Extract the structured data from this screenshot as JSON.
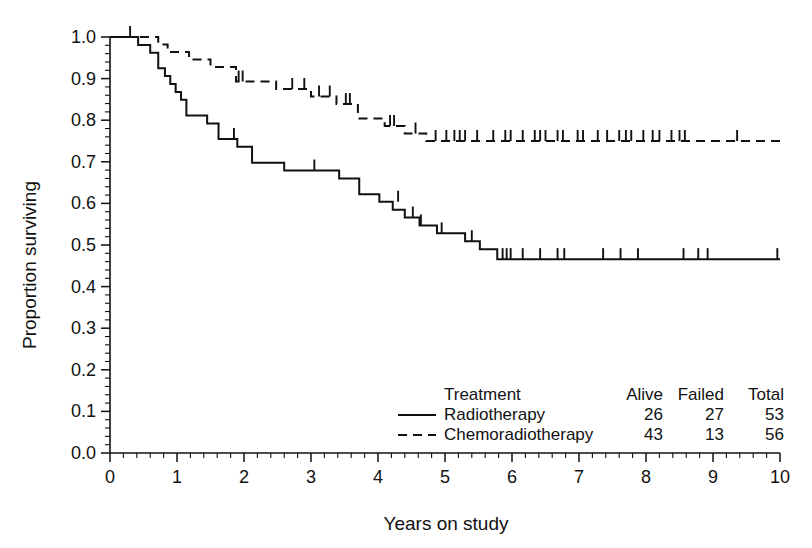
{
  "chart_data": {
    "type": "line",
    "subtype": "kaplan-meier-survival",
    "title": "",
    "xlabel": "Years on study",
    "ylabel": "Proportion surviving",
    "xlim": [
      0,
      10
    ],
    "ylim": [
      0,
      1
    ],
    "xticks": [
      "0",
      "1",
      "2",
      "3",
      "4",
      "5",
      "6",
      "7",
      "8",
      "9",
      "10"
    ],
    "yticks": [
      "0.0",
      "0.1",
      "0.2",
      "0.3",
      "0.4",
      "0.5",
      "0.6",
      "0.7",
      "0.8",
      "0.9",
      "1.0"
    ],
    "x_minor_per_major": 4,
    "y_minor_per_major": 4,
    "grid": false,
    "legend_position": "inside-lower-right",
    "series": [
      {
        "name": "Radiotherapy",
        "linestyle": "solid",
        "color": "#111111",
        "alive": 26,
        "failed": 27,
        "total": 53,
        "steps": [
          [
            0.0,
            1.0
          ],
          [
            0.42,
            1.0
          ],
          [
            0.42,
            0.981
          ],
          [
            0.6,
            0.981
          ],
          [
            0.6,
            0.962
          ],
          [
            0.72,
            0.962
          ],
          [
            0.72,
            0.925
          ],
          [
            0.82,
            0.925
          ],
          [
            0.82,
            0.906
          ],
          [
            0.9,
            0.906
          ],
          [
            0.9,
            0.887
          ],
          [
            0.98,
            0.887
          ],
          [
            0.98,
            0.868
          ],
          [
            1.06,
            0.868
          ],
          [
            1.06,
            0.849
          ],
          [
            1.14,
            0.849
          ],
          [
            1.14,
            0.811
          ],
          [
            1.45,
            0.811
          ],
          [
            1.45,
            0.792
          ],
          [
            1.62,
            0.792
          ],
          [
            1.62,
            0.755
          ],
          [
            1.9,
            0.755
          ],
          [
            1.9,
            0.736
          ],
          [
            2.12,
            0.736
          ],
          [
            2.12,
            0.698
          ],
          [
            2.6,
            0.698
          ],
          [
            2.6,
            0.679
          ],
          [
            3.42,
            0.679
          ],
          [
            3.42,
            0.66
          ],
          [
            3.72,
            0.66
          ],
          [
            3.72,
            0.622
          ],
          [
            4.02,
            0.622
          ],
          [
            4.02,
            0.604
          ],
          [
            4.22,
            0.604
          ],
          [
            4.22,
            0.585
          ],
          [
            4.4,
            0.585
          ],
          [
            4.4,
            0.566
          ],
          [
            4.62,
            0.566
          ],
          [
            4.62,
            0.547
          ],
          [
            4.88,
            0.547
          ],
          [
            4.88,
            0.528
          ],
          [
            5.3,
            0.528
          ],
          [
            5.3,
            0.509
          ],
          [
            5.52,
            0.509
          ],
          [
            5.52,
            0.49
          ],
          [
            5.78,
            0.49
          ],
          [
            5.78,
            0.466
          ],
          [
            10.0,
            0.466
          ]
        ],
        "censored": [
          [
            0.3,
            1.0
          ],
          [
            1.85,
            0.755
          ],
          [
            3.05,
            0.679
          ],
          [
            4.3,
            0.604
          ],
          [
            4.52,
            0.566
          ],
          [
            4.64,
            0.547
          ],
          [
            4.95,
            0.528
          ],
          [
            5.4,
            0.509
          ],
          [
            5.86,
            0.466
          ],
          [
            5.92,
            0.466
          ],
          [
            5.98,
            0.466
          ],
          [
            6.16,
            0.466
          ],
          [
            6.42,
            0.466
          ],
          [
            6.68,
            0.466
          ],
          [
            6.78,
            0.466
          ],
          [
            7.36,
            0.466
          ],
          [
            7.62,
            0.466
          ],
          [
            7.88,
            0.466
          ],
          [
            8.56,
            0.466
          ],
          [
            8.78,
            0.466
          ],
          [
            8.92,
            0.466
          ],
          [
            9.96,
            0.466
          ]
        ]
      },
      {
        "name": "Chemoradiotherapy",
        "linestyle": "dashed",
        "color": "#111111",
        "alive": 43,
        "failed": 13,
        "total": 56,
        "steps": [
          [
            0.0,
            1.0
          ],
          [
            0.72,
            1.0
          ],
          [
            0.72,
            0.982
          ],
          [
            0.86,
            0.982
          ],
          [
            0.86,
            0.964
          ],
          [
            1.18,
            0.964
          ],
          [
            1.18,
            0.946
          ],
          [
            1.5,
            0.946
          ],
          [
            1.5,
            0.928
          ],
          [
            1.88,
            0.928
          ],
          [
            1.88,
            0.893
          ],
          [
            2.48,
            0.893
          ],
          [
            2.48,
            0.875
          ],
          [
            3.0,
            0.875
          ],
          [
            3.0,
            0.857
          ],
          [
            3.38,
            0.857
          ],
          [
            3.38,
            0.839
          ],
          [
            3.7,
            0.839
          ],
          [
            3.7,
            0.804
          ],
          [
            4.1,
            0.804
          ],
          [
            4.1,
            0.786
          ],
          [
            4.4,
            0.786
          ],
          [
            4.4,
            0.768
          ],
          [
            4.72,
            0.768
          ],
          [
            4.72,
            0.75
          ],
          [
            10.0,
            0.75
          ]
        ],
        "censored": [
          [
            1.92,
            0.893
          ],
          [
            1.98,
            0.893
          ],
          [
            2.72,
            0.875
          ],
          [
            2.9,
            0.875
          ],
          [
            3.12,
            0.857
          ],
          [
            3.28,
            0.857
          ],
          [
            3.52,
            0.839
          ],
          [
            3.58,
            0.839
          ],
          [
            4.18,
            0.786
          ],
          [
            4.24,
            0.786
          ],
          [
            4.56,
            0.768
          ],
          [
            4.86,
            0.75
          ],
          [
            5.02,
            0.75
          ],
          [
            5.14,
            0.75
          ],
          [
            5.22,
            0.75
          ],
          [
            5.3,
            0.75
          ],
          [
            5.48,
            0.75
          ],
          [
            5.72,
            0.75
          ],
          [
            5.9,
            0.75
          ],
          [
            5.98,
            0.75
          ],
          [
            6.16,
            0.75
          ],
          [
            6.34,
            0.75
          ],
          [
            6.42,
            0.75
          ],
          [
            6.5,
            0.75
          ],
          [
            6.68,
            0.75
          ],
          [
            6.76,
            0.75
          ],
          [
            6.98,
            0.75
          ],
          [
            7.06,
            0.75
          ],
          [
            7.28,
            0.75
          ],
          [
            7.42,
            0.75
          ],
          [
            7.6,
            0.75
          ],
          [
            7.7,
            0.75
          ],
          [
            7.78,
            0.75
          ],
          [
            7.96,
            0.75
          ],
          [
            8.1,
            0.75
          ],
          [
            8.2,
            0.75
          ],
          [
            8.38,
            0.75
          ],
          [
            8.5,
            0.75
          ],
          [
            8.58,
            0.75
          ],
          [
            9.36,
            0.75
          ]
        ]
      }
    ],
    "legend": {
      "header_label": "Treatment",
      "columns": [
        "Alive",
        "Failed",
        "Total"
      ],
      "rows": [
        {
          "label": "Radiotherapy",
          "linestyle": "solid",
          "alive": "26",
          "failed": "27",
          "total": "53"
        },
        {
          "label": "Chemoradiotherapy",
          "linestyle": "dashed",
          "alive": "43",
          "failed": "13",
          "total": "56"
        }
      ]
    }
  }
}
